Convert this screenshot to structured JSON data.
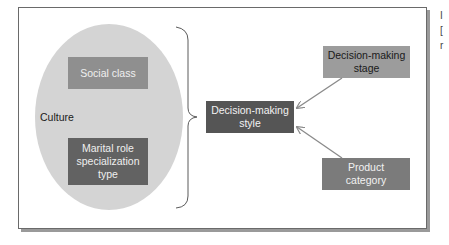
{
  "diagram": {
    "container_label": "Culture",
    "nodes": {
      "social_class": "Social class",
      "marital_role": "Marital role specialization type",
      "decision_style": "Decision-making style",
      "decision_stage": "Decision-making stage",
      "product_category": "Product category"
    },
    "edges": [
      {
        "from": "Decision-making stage",
        "to": "Decision-making style"
      },
      {
        "from": "Product category",
        "to": "Decision-making style"
      },
      {
        "from": "Culture (Social class, Marital role specialization type)",
        "to": "Decision-making style",
        "via": "brace"
      }
    ],
    "colors": {
      "ellipse": "#d4d4d4",
      "social_class": "#8f8f8f",
      "marital_role": "#626262",
      "decision_style": "#555555",
      "decision_stage": "#9c9c9c",
      "product_category": "#7b7b7b",
      "arrow": "#8a8a8a"
    }
  },
  "side_fragments": [
    "I",
    "[",
    "r"
  ]
}
